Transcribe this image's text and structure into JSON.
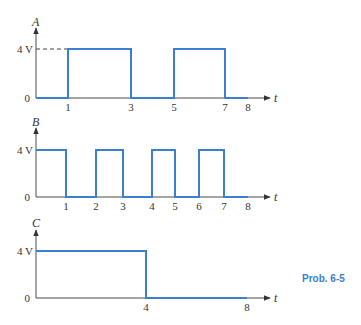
{
  "caption": "Prob. 6-5",
  "colors": {
    "waveform": "#3a7fd0",
    "axis": "#4a4a4a",
    "caption": "#3a7fd0"
  },
  "chart_data": [
    {
      "type": "line",
      "name": "A",
      "ylabel": "A",
      "xlabel": "t",
      "y_ticks": [
        "0",
        "4 V"
      ],
      "x_ticks": [
        "1",
        "3",
        "5",
        "7",
        "8"
      ],
      "dashed_reference_to_4V": true,
      "steps": [
        [
          0,
          0
        ],
        [
          1,
          4
        ],
        [
          3,
          0
        ],
        [
          5,
          4
        ],
        [
          7,
          0
        ],
        [
          8,
          0
        ]
      ],
      "layout": {
        "y0": 98,
        "y4": 49,
        "top": 28,
        "label_y": 22,
        "xmap": {
          "0": 36,
          "1": 68,
          "3": 131,
          "5": 174,
          "7": 225,
          "8": 248
        }
      }
    },
    {
      "type": "line",
      "name": "B",
      "ylabel": "B",
      "xlabel": "t",
      "y_ticks": [
        "0",
        "4 V"
      ],
      "x_ticks": [
        "1",
        "2",
        "3",
        "4",
        "5",
        "6",
        "7",
        "8"
      ],
      "steps": [
        [
          0,
          4
        ],
        [
          1,
          0
        ],
        [
          2,
          4
        ],
        [
          3,
          0
        ],
        [
          4,
          4
        ],
        [
          5,
          0
        ],
        [
          6,
          4
        ],
        [
          7,
          0
        ],
        [
          8,
          0
        ]
      ],
      "layout": {
        "y0": 197,
        "y4": 150,
        "top": 128,
        "label_y": 122,
        "xmap": {
          "0": 36,
          "1": 66,
          "2": 96,
          "3": 123,
          "4": 152,
          "5": 175,
          "6": 199,
          "7": 224,
          "8": 248
        }
      }
    },
    {
      "type": "line",
      "name": "C",
      "ylabel": "C",
      "xlabel": "t",
      "y_ticks": [
        "0",
        "4 V"
      ],
      "x_ticks": [
        "4",
        "8"
      ],
      "steps": [
        [
          0,
          4
        ],
        [
          4,
          0
        ],
        [
          8,
          0
        ]
      ],
      "layout": {
        "y0": 298,
        "y4": 251,
        "top": 230,
        "label_y": 223,
        "xmap": {
          "0": 36,
          "4": 146,
          "8": 247
        }
      }
    }
  ]
}
